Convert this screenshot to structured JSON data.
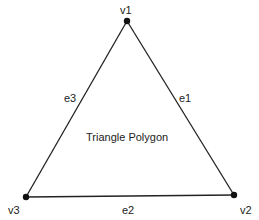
{
  "diagram": {
    "title": "Triangle Polygon",
    "vertices": [
      {
        "id": "v1",
        "label": "v1",
        "x": 127,
        "y": 21
      },
      {
        "id": "v2",
        "label": "v2",
        "x": 234,
        "y": 195
      },
      {
        "id": "v3",
        "label": "v3",
        "x": 26,
        "y": 197
      }
    ],
    "edges": [
      {
        "id": "e1",
        "label": "e1",
        "from": "v1",
        "to": "v2"
      },
      {
        "id": "e2",
        "label": "e2",
        "from": "v2",
        "to": "v3"
      },
      {
        "id": "e3",
        "label": "e3",
        "from": "v3",
        "to": "v1"
      }
    ],
    "colors": {
      "stroke": "#222222",
      "vertex": "#111111",
      "background": "#ffffff"
    }
  }
}
